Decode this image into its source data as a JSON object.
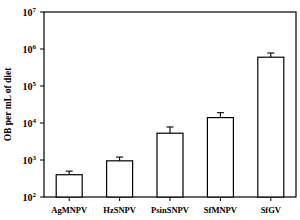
{
  "chart_data": {
    "type": "bar",
    "title": "",
    "xlabel": "",
    "ylabel": "OB per mL of diet",
    "yscale": "log",
    "ylim": [
      100,
      10000000
    ],
    "yticks": [
      {
        "base": "10",
        "exp": "2",
        "value": 100
      },
      {
        "base": "10",
        "exp": "3",
        "value": 1000
      },
      {
        "base": "10",
        "exp": "4",
        "value": 10000
      },
      {
        "base": "10",
        "exp": "5",
        "value": 100000
      },
      {
        "base": "10",
        "exp": "6",
        "value": 1000000
      },
      {
        "base": "10",
        "exp": "7",
        "value": 10000000
      }
    ],
    "categories": [
      "AgMNPV",
      "HzSNPV",
      "PsinSNPV",
      "SfMNPV",
      "SfGV"
    ],
    "values": [
      400,
      950,
      5300,
      14000,
      600000
    ],
    "error_upper": [
      500,
      1200,
      7800,
      19000,
      780000
    ],
    "grid": false,
    "legend": null,
    "colors": {
      "bar_fill": "#ffffff",
      "bar_stroke": "#000000",
      "axis": "#000000"
    }
  }
}
